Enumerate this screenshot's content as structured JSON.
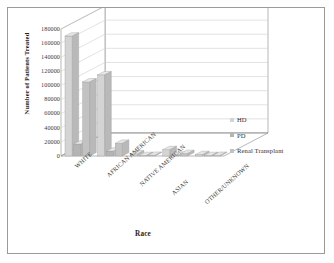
{
  "chart_data": {
    "type": "bar",
    "title": "",
    "subtitle": "",
    "xlabel": "Race",
    "ylabel": "Number of Patients Treated",
    "categories": [
      "WHITE",
      "AFRICAN AMERICAN",
      "NATIVE AMERICAN",
      "ASIAN",
      "OTHER/UNKNOWN"
    ],
    "series": [
      {
        "name": "HD",
        "color": "#d4d4d4",
        "values": [
          170000,
          115000,
          3000,
          9000,
          2000
        ]
      },
      {
        "name": "PD",
        "color": "#b4b4b4",
        "values": [
          17000,
          7000,
          400,
          1200,
          300
        ]
      },
      {
        "name": "Renal Transplant",
        "color": "#c2c2c2",
        "values": [
          105000,
          18000,
          900,
          3500,
          800
        ]
      }
    ],
    "ylim": [
      0,
      180000
    ],
    "ytick_step": 20000,
    "yticks": [
      180000,
      160000,
      140000,
      120000,
      100000,
      80000,
      60000,
      40000,
      20000,
      0
    ],
    "ytick_labels": [
      "180000",
      "160000",
      "140000",
      "120000",
      "100000",
      "80000",
      "60000",
      "40000",
      "20000",
      "0"
    ],
    "grid": true,
    "grid_axis": "y",
    "legend_position": "right",
    "three_d": true,
    "plot_background": "#ffffff",
    "grid_color": "#cfcfcf",
    "axis_color": "#9a9a9a",
    "text_color": "#2b2b2b"
  },
  "legend": {
    "entries": [
      {
        "label": "HD",
        "color": "#d4d4d4"
      },
      {
        "label": "PD",
        "color": "#b4b4b4"
      },
      {
        "label": "Renal Transplant",
        "color": "#c2c2c2"
      }
    ]
  },
  "figure": {
    "border_color": "#9a9a9a",
    "background": "#ffffff"
  }
}
